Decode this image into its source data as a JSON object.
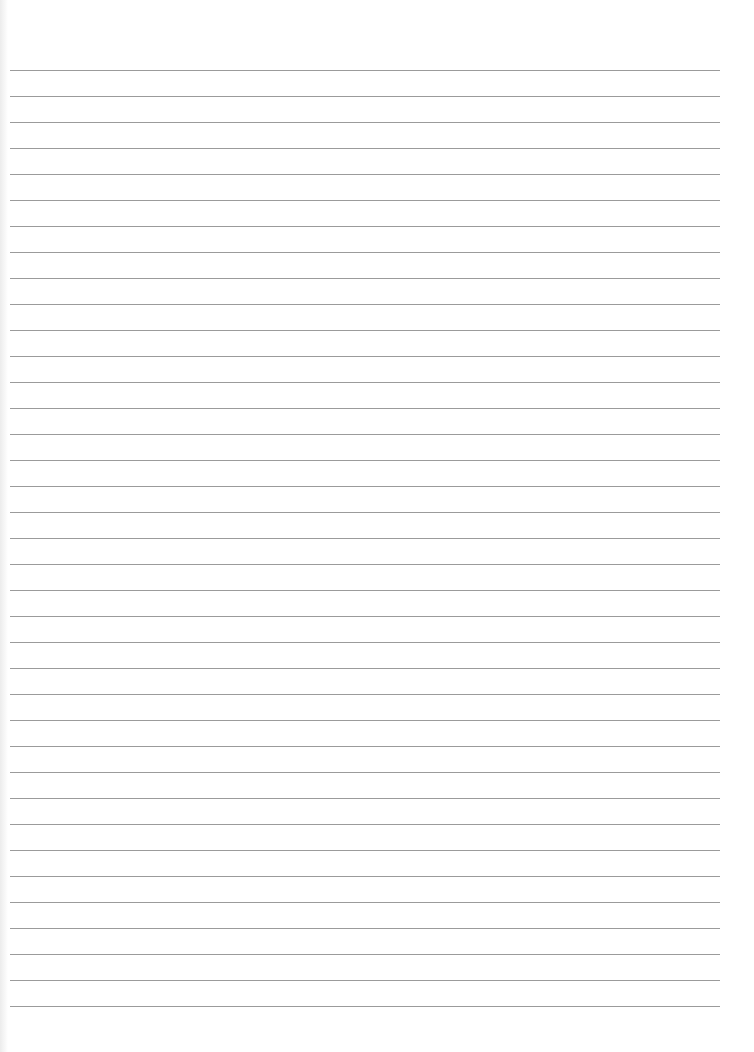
{
  "page": {
    "type": "lined-paper",
    "background": "#ffffff",
    "line_color": "#8a8a8a",
    "line_count": 37,
    "first_line_y": 70,
    "line_spacing": 26.0,
    "line_left": 10,
    "line_width": 710
  }
}
